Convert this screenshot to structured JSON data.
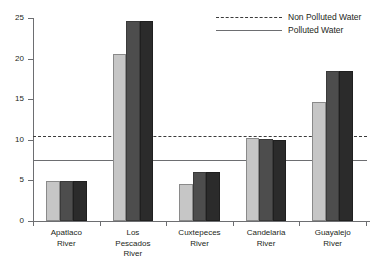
{
  "chart_data": {
    "type": "bar",
    "title": "",
    "xlabel": "",
    "ylabel": "",
    "ylim": [
      0,
      25
    ],
    "yticks": [
      0,
      5,
      10,
      15,
      20,
      25
    ],
    "grid": false,
    "legend_position": "top-right",
    "categories": [
      "Apatlaco River",
      "Los Pescados River",
      "Cuxtepeces River",
      "Candelaria River",
      "Guayalejo River"
    ],
    "category_lines": [
      [
        "Apatlaco",
        "River"
      ],
      [
        "Los",
        "Pescados",
        "River"
      ],
      [
        "Cuxtepeces",
        "River"
      ],
      [
        "Candelaria",
        "River"
      ],
      [
        "Guayalejo",
        "River"
      ]
    ],
    "series": [
      {
        "name": "series-1",
        "color": "#c6c6c6",
        "values": [
          4.9,
          20.6,
          4.6,
          10.2,
          14.7
        ]
      },
      {
        "name": "series-2",
        "color": "#4d4d4d",
        "values": [
          4.9,
          24.6,
          6.0,
          10.1,
          18.5
        ]
      },
      {
        "name": "series-3",
        "color": "#2b2b2b",
        "values": [
          4.9,
          24.6,
          6.0,
          10.0,
          18.5
        ]
      }
    ],
    "reference_lines": [
      {
        "name": "Non Polluted Water",
        "value": 10.5,
        "style": "dashed",
        "color": "#3b3b3b"
      },
      {
        "name": "Polluted Water",
        "value": 7.5,
        "style": "solid",
        "color": "#6d6e71"
      }
    ]
  },
  "legend": {
    "items": [
      {
        "label": "Non Polluted Water",
        "style": "dashed"
      },
      {
        "label": "Polluted Water",
        "style": "solid"
      }
    ]
  },
  "axis": {
    "ytick_labels": [
      "0",
      "5",
      "10",
      "15",
      "20",
      "25"
    ]
  }
}
